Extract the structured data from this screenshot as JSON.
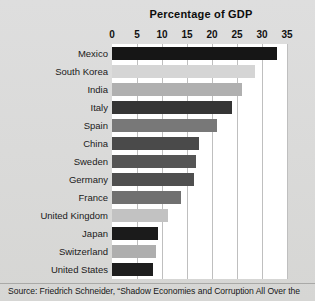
{
  "chart_data": {
    "type": "bar",
    "orientation": "horizontal",
    "title": "Percentage of GDP",
    "xlabel": "",
    "ylabel": "",
    "xlim": [
      0,
      35
    ],
    "xticks": [
      0,
      5,
      10,
      15,
      20,
      25,
      30,
      35
    ],
    "xtick_labels": [
      "0",
      "5",
      "10",
      "15",
      "20",
      "25",
      "30",
      "35"
    ],
    "grid": true,
    "grid_axis": "x",
    "legend": "none",
    "categories": [
      "Mexico",
      "South Korea",
      "India",
      "Italy",
      "Spain",
      "China",
      "Sweden",
      "Germany",
      "France",
      "United Kingdom",
      "Japan",
      "Switzerland",
      "United States"
    ],
    "values": [
      33,
      28.5,
      26,
      24,
      21,
      17.4,
      16.7,
      16.3,
      13.8,
      11.2,
      9.2,
      8.8,
      8.2
    ],
    "bar_colors": [
      "#161616",
      "#d5d5d5",
      "#b0b0b0",
      "#353535",
      "#787878",
      "#4a4a4a",
      "#555555",
      "#4f4f4f",
      "#707070",
      "#c2c2c2",
      "#1b1b1b",
      "#aeaeae",
      "#1e1e1e"
    ]
  },
  "footer": {
    "source_note": "Source: Friedrich Schneider, “Shadow Economies and Corruption All Over the"
  },
  "colors": {
    "page_background": "#d9d9d7",
    "plot_background": "#ffffff",
    "gridline": "#bfbfbf",
    "text": "#111111"
  }
}
